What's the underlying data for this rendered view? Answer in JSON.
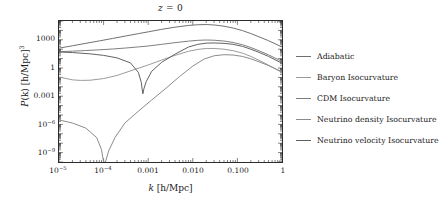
{
  "chart_data": {
    "type": "line",
    "title": "z = 0",
    "xlabel": "k [h/Mpc]",
    "ylabel": "P(k) [h/Mpc]^3",
    "xscale": "log",
    "yscale": "log",
    "xlim": [
      1e-05,
      1
    ],
    "ylim": [
      1e-10,
      100000.0
    ],
    "grid": false,
    "legend_position": "right",
    "xticks": [
      {
        "value": 1e-05,
        "label": "10−5"
      },
      {
        "value": 0.0001,
        "label": "10−4"
      },
      {
        "value": 0.001,
        "label": "0.001"
      },
      {
        "value": 0.01,
        "label": "0.010"
      },
      {
        "value": 0.1,
        "label": "0.100"
      },
      {
        "value": 1.0,
        "label": "1"
      }
    ],
    "yticks": [
      {
        "value": 1000,
        "label": "1000"
      },
      {
        "value": 1,
        "label": "1"
      },
      {
        "value": 0.001,
        "label": "0.001"
      },
      {
        "value": 1e-06,
        "label": "10−6"
      },
      {
        "value": 1e-09,
        "label": "10−9"
      }
    ],
    "series": [
      {
        "name": "Adiabatic",
        "color": "#6f6f6f",
        "x": [
          1e-05,
          2e-05,
          4e-05,
          8e-05,
          0.00016,
          0.00032,
          0.0006,
          0.001,
          0.002,
          0.004,
          0.008,
          0.013,
          0.02,
          0.03,
          0.05,
          0.08,
          0.13,
          0.2,
          0.32,
          0.5,
          1.0
        ],
        "y": [
          130.0,
          230.0,
          420.0,
          760.0,
          1400.0,
          2600.0,
          4500.0,
          7000.0,
          13000.0,
          22000.0,
          34000.0,
          40000.0,
          42000.0,
          38000.0,
          28000.0,
          18000.0,
          9500.0,
          4600.0,
          1900.0,
          800.0,
          170.0
        ]
      },
      {
        "name": "Baryon Isocurvature",
        "color": "#9a9a9a",
        "x": [
          1e-05,
          2e-05,
          3e-05,
          5e-05,
          0.0001,
          0.0002,
          0.0005,
          0.001,
          0.002,
          0.004,
          0.008,
          0.013,
          0.02,
          0.03,
          0.05,
          0.08,
          0.13,
          0.2,
          0.32,
          0.5,
          1.0
        ],
        "y": [
          0.11,
          0.055,
          0.048,
          0.05,
          0.075,
          0.16,
          0.7,
          2.1,
          7.0,
          22.0,
          60.0,
          95.0,
          120.0,
          120.0,
          100.0,
          70.0,
          38.0,
          17.0,
          6.0,
          2.0,
          0.33
        ]
      },
      {
        "name": "CDM Isocurvature",
        "color": "#7d7d7d",
        "x": [
          1e-05,
          2e-05,
          4e-05,
          8e-05,
          0.00016,
          0.00032,
          0.0006,
          0.001,
          0.002,
          0.004,
          0.008,
          0.013,
          0.02,
          0.03,
          0.05,
          0.08,
          0.13,
          0.2,
          0.32,
          0.5,
          1.0
        ],
        "y": [
          55.0,
          62.0,
          72.0,
          86.0,
          105.0,
          135.0,
          175.0,
          220.0,
          330.0,
          500.0,
          720.0,
          880.0,
          950.0,
          900.0,
          740.0,
          520.0,
          300.0,
          150.0,
          62.0,
          25.0,
          5.0
        ]
      },
      {
        "name": "Neutrino density Isocurvature",
        "color": "#8a8a8a",
        "x": [
          1e-05,
          2e-05,
          4e-05,
          7e-05,
          9e-05,
          0.0001,
          0.000105,
          0.00011,
          0.00013,
          0.00018,
          0.0003,
          0.0006,
          0.0012,
          0.0025,
          0.005,
          0.01,
          0.018,
          0.03,
          0.05,
          0.08,
          0.13,
          0.2,
          0.32,
          0.5,
          1.0
        ],
        "y": [
          3e-06,
          1.4e-06,
          4e-07,
          4e-08,
          2e-09,
          2e-11,
          6e-12,
          2e-11,
          1.5e-09,
          4e-08,
          1.4e-06,
          2.5e-05,
          0.0004,
          0.007,
          0.12,
          1.6,
          9.0,
          20.0,
          26.0,
          24.0,
          17.0,
          9.5,
          4.2,
          1.8,
          0.4
        ]
      },
      {
        "name": "Neutrino velocity Isocurvature",
        "color": "#606060",
        "x": [
          1e-05,
          2e-05,
          5e-05,
          0.0001,
          0.0002,
          0.0004,
          0.0006,
          0.0007,
          0.00073,
          0.00076,
          0.0008,
          0.0009,
          0.0012,
          0.002,
          0.004,
          0.008,
          0.013,
          0.02,
          0.03,
          0.05,
          0.08,
          0.13,
          0.2,
          0.32,
          0.5,
          1.0
        ],
        "y": [
          50.0,
          44.0,
          32.0,
          22.0,
          12.0,
          3.5,
          0.35,
          0.03,
          0.006,
          0.0018,
          0.006,
          0.035,
          0.45,
          4.0,
          30.0,
          170.0,
          330.0,
          440.0,
          460.0,
          420.0,
          330.0,
          200.0,
          100.0,
          42.0,
          17.0,
          3.2
        ]
      }
    ]
  },
  "title": {
    "variable": "z",
    "equals": " = ",
    "value": "0"
  },
  "axes": {
    "x_title_sym": "k",
    "x_title_unit": " [h/Mpc]",
    "y_title_p": "P",
    "y_title_k": "(k)",
    "y_title_unit": " [h/Mpc]",
    "y_title_exp": "3"
  },
  "legend": {
    "items": [
      {
        "label": "Adiabatic",
        "color": "#6f6f6f"
      },
      {
        "label": "Baryon Isocurvature",
        "color": "#9a9a9a"
      },
      {
        "label": "CDM Isocurvature",
        "color": "#7d7d7d"
      },
      {
        "label": "Neutrino density Isocurvature",
        "color": "#8a8a8a"
      },
      {
        "label": "Neutrino velocity Isocurvature",
        "color": "#606060"
      }
    ]
  }
}
